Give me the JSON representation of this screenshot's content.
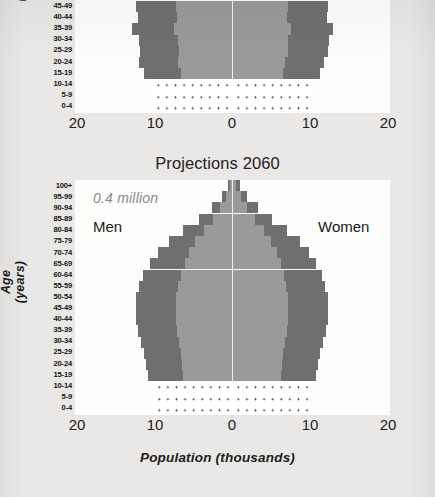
{
  "figure": {
    "x_axis_title": "Population (thousands)",
    "y_axis_title": "Age (years)"
  },
  "panels": [
    {
      "id": "top",
      "title": "",
      "note": "",
      "men_label": "",
      "women_label": ""
    },
    {
      "id": "bottom",
      "title": "Projections 2060",
      "note": "0.4 million",
      "men_label": "Men",
      "women_label": "Women"
    }
  ],
  "axis": {
    "x_ticks": [
      "20",
      "10",
      "0",
      "10",
      "20"
    ],
    "age_groups": [
      "100+",
      "95-99",
      "90-94",
      "85-89",
      "80-84",
      "75-79",
      "70-74",
      "65-69",
      "60-64",
      "55-59",
      "50-54",
      "45-49",
      "40-44",
      "35-39",
      "30-34",
      "25-29",
      "20-24",
      "15-19",
      "10-14",
      "5-9",
      "0-4"
    ]
  },
  "colors": {
    "bar_outer": "#6f6f6f",
    "bar_inner": "#9a9a9a",
    "page_background": "#e9e8e6",
    "plot_background": "#fdfdfc",
    "note_text": "#8a8a88"
  },
  "chart_data": {
    "type": "bar",
    "title": "Projections 2060",
    "subtitle": "0.4 million",
    "xlabel": "Population (thousands)",
    "ylabel": "Age (years)",
    "xlim": [
      -25,
      25
    ],
    "x_ticks": [
      -20,
      -10,
      0,
      10,
      20
    ],
    "x_tick_labels": [
      "20",
      "10",
      "0",
      "10",
      "20"
    ],
    "grid": false,
    "legend": [
      "Men",
      "Women"
    ],
    "legend_position": "inside-top-left-and-right",
    "categories": [
      "100+",
      "95-99",
      "90-94",
      "85-89",
      "80-84",
      "75-79",
      "70-74",
      "65-69",
      "60-64",
      "55-59",
      "50-54",
      "45-49",
      "40-44",
      "35-39",
      "30-34",
      "25-29",
      "20-24",
      "15-19",
      "10-14",
      "5-9",
      "0-4"
    ],
    "panels": [
      {
        "name": "Projections 2060",
        "series": [
          {
            "name": "Men",
            "values": [
              0.5,
              1.3,
              2.6,
              4.3,
              6.3,
              8.2,
              9.6,
              10.6,
              11.5,
              12.0,
              12.4,
              12.5,
              12.4,
              12.2,
              11.8,
              11.4,
              11.2,
              10.9,
              10.2,
              10.2,
              10.2
            ]
          },
          {
            "name": "Women",
            "values": [
              1.0,
              2.0,
              3.4,
              5.2,
              7.1,
              8.8,
              10.0,
              10.9,
              11.6,
              12.1,
              12.4,
              12.5,
              12.4,
              12.2,
              11.8,
              11.4,
              11.2,
              10.9,
              10.2,
              10.2,
              10.2
            ]
          }
        ]
      },
      {
        "name": "Top panel (cropped)",
        "series": [
          {
            "name": "Men",
            "values": [
              null,
              null,
              null,
              null,
              null,
              null,
              null,
              null,
              null,
              null,
              null,
              12.4,
              12.2,
              13.0,
              12.1,
              11.9,
              12.1,
              11.4,
              10.3,
              10.3,
              10.3
            ]
          },
          {
            "name": "Women",
            "values": [
              null,
              null,
              null,
              null,
              null,
              null,
              null,
              null,
              null,
              null,
              null,
              12.4,
              12.3,
              13.1,
              12.6,
              12.4,
              11.9,
              11.4,
              10.3,
              10.3,
              10.3
            ]
          }
        ]
      }
    ]
  }
}
